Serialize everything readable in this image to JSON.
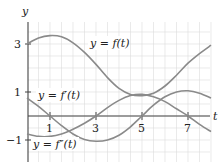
{
  "chart_data": {
    "type": "line",
    "title": "",
    "xlabel": "t",
    "ylabel": "y",
    "xlim": [
      0,
      8
    ],
    "ylim": [
      -1.9,
      3.9
    ],
    "grid": true,
    "x_ticks": [
      "1",
      "3",
      "5",
      "7"
    ],
    "y_ticks": [
      "3",
      "1",
      "−1"
    ],
    "series": [
      {
        "name": "y = f(t)",
        "x": [
          0,
          0.5,
          1,
          1.5,
          2,
          2.5,
          3,
          3.5,
          4,
          4.5,
          5,
          5.5,
          6,
          6.5,
          7,
          7.5,
          8
        ],
        "values": [
          3.0,
          3.25,
          3.35,
          3.3,
          3.05,
          2.65,
          2.15,
          1.6,
          1.15,
          0.9,
          0.85,
          0.95,
          1.25,
          1.7,
          2.2,
          2.6,
          2.95
        ]
      },
      {
        "name": "y = f'(t)",
        "x": [
          0,
          0.5,
          1,
          1.5,
          2,
          2.5,
          3,
          3.5,
          4,
          4.5,
          5,
          5.5,
          6,
          6.5,
          7,
          7.5,
          8
        ],
        "values": [
          0.75,
          0.4,
          0.0,
          -0.4,
          -0.75,
          -0.98,
          -1.05,
          -1.0,
          -0.8,
          -0.45,
          0.0,
          0.45,
          0.8,
          1.0,
          1.05,
          0.95,
          0.75
        ]
      },
      {
        "name": "y = f''(t)",
        "x": [
          0,
          0.5,
          1,
          1.5,
          2,
          2.5,
          3,
          3.5,
          4,
          4.5,
          5,
          5.5,
          6,
          6.5,
          7,
          7.5,
          8
        ],
        "values": [
          -0.75,
          -0.85,
          -0.85,
          -0.75,
          -0.55,
          -0.3,
          0.0,
          0.35,
          0.65,
          0.85,
          0.9,
          0.8,
          0.6,
          0.3,
          0.0,
          -0.35,
          -0.65
        ]
      }
    ],
    "annotations": [
      {
        "text": "y = f(t)",
        "x": 3.0,
        "y": 2.95
      },
      {
        "text": "y = f'(t)",
        "x": 0.5,
        "y": 0.8
      },
      {
        "text": "y = f''(t)",
        "x": 0.3,
        "y": -1.2
      }
    ]
  },
  "labels": {
    "y_axis": "y",
    "t_axis": "t",
    "tick_x": [
      "1",
      "3",
      "5",
      "7"
    ],
    "tick_y": [
      "3",
      "1",
      "−1"
    ],
    "f": "y = f(t)",
    "fp": "y = f′(t)",
    "fpp": "y = f″(t)"
  }
}
